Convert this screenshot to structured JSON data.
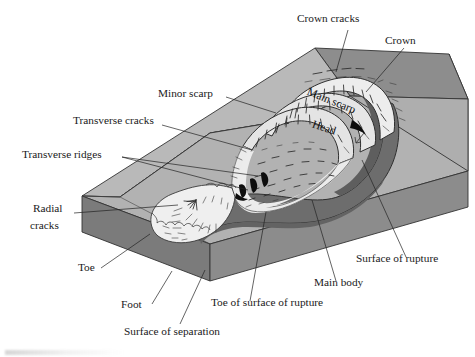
{
  "figure": {
    "type": "annotated-block-diagram",
    "width": 475,
    "height": 357,
    "background": "#ffffff"
  },
  "labels": {
    "crown_cracks": "Crown cracks",
    "crown": "Crown",
    "minor_scarp": "Minor scarp",
    "transverse_cracks": "Transverse cracks",
    "transverse_ridges": "Transverse ridges",
    "radial_cracks_line1": "Radial",
    "radial_cracks_line2": "cracks",
    "toe": "Toe",
    "foot": "Foot",
    "surface_of_separation": "Surface of separation",
    "toe_of_surface_of_rupture": "Toe of surface of rupture",
    "main_body": "Main body",
    "surface_of_rupture": "Surface of rupture",
    "main_scarp": "Main scarp",
    "head": "Head"
  },
  "colors": {
    "ground_top": "#b7b7b7",
    "ground_top_light": "#c2c2c2",
    "block_front_face": "#8f8f8f",
    "block_left_face": "#7e7e7e",
    "block_right_face": "#8a8a8a",
    "slope_face": "#a8a8a8",
    "rupture_surface": "#6f6f6f",
    "rupture_surface_dark": "#5f5f5f",
    "slide_mass": "#efefef",
    "slide_mass_shadow": "#e2e2e2",
    "scarp_fill": "#e9e9e9",
    "outline": "#333333",
    "text": "#1a1a1a",
    "crack_stroke": "#2b2b2b",
    "arrow_black": "#0d0d0d"
  },
  "leaders": [
    {
      "name": "crown-cracks-leader",
      "from": [
        350,
        28
      ],
      "to": [
        336,
        72
      ]
    },
    {
      "name": "crown-leader",
      "from": [
        406,
        46
      ],
      "to": [
        368,
        92
      ]
    },
    {
      "name": "minor-scarp-leader",
      "from": [
        225,
        95
      ],
      "to": [
        270,
        112
      ]
    },
    {
      "name": "transverse-cracks-leader",
      "from": [
        160,
        123
      ],
      "to": [
        243,
        146
      ]
    },
    {
      "name": "transverse-ridges-leader-a",
      "from": [
        118,
        155
      ],
      "to": [
        243,
        189
      ]
    },
    {
      "name": "transverse-ridges-leader-b",
      "from": [
        118,
        155
      ],
      "to": [
        253,
        174
      ]
    },
    {
      "name": "radial-cracks-leader",
      "from": [
        72,
        213
      ],
      "to": [
        166,
        205
      ]
    },
    {
      "name": "toe-leader",
      "from": [
        100,
        268
      ],
      "to": [
        148,
        236
      ]
    },
    {
      "name": "foot-leader",
      "from": [
        152,
        305
      ],
      "to": [
        172,
        272
      ]
    },
    {
      "name": "surface-of-separation-leader",
      "from": [
        178,
        326
      ],
      "to": [
        203,
        272
      ]
    },
    {
      "name": "toe-of-surface-of-rupture-leader",
      "from": [
        248,
        303
      ],
      "to": [
        265,
        212
      ]
    },
    {
      "name": "main-body-leader",
      "from": [
        336,
        282
      ],
      "to": [
        310,
        200
      ]
    },
    {
      "name": "surface-of-rupture-leader",
      "from": [
        406,
        258
      ],
      "to": [
        360,
        160
      ]
    }
  ],
  "features": [
    "crown cracks",
    "crown",
    "main scarp",
    "head",
    "minor scarp",
    "transverse cracks",
    "transverse ridges",
    "radial cracks",
    "toe",
    "foot",
    "surface of separation",
    "toe of surface of rupture",
    "main body",
    "surface of rupture"
  ]
}
